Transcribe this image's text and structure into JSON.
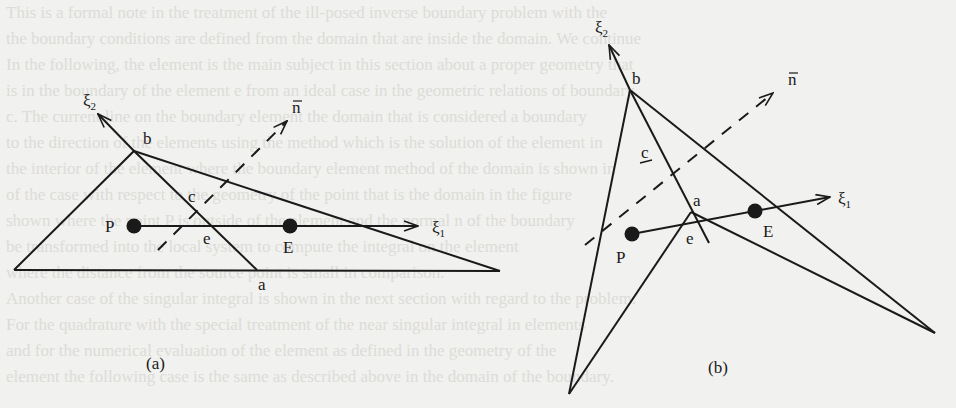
{
  "figure": {
    "panels": [
      {
        "id": "a",
        "caption": "(a)",
        "labels": {
          "xi2": "ξ",
          "xi2_sub": "2",
          "xi1": "ξ",
          "xi1_sub": "1",
          "n": "n",
          "b": "b",
          "c": "c",
          "e": "e",
          "a": "a",
          "P": "P",
          "E": "E"
        }
      },
      {
        "id": "b",
        "caption": "(b)",
        "labels": {
          "xi2": "ξ",
          "xi2_sub": "2",
          "xi1": "ξ",
          "xi1_sub": "1",
          "n": "n",
          "b": "b",
          "c": "c",
          "e": "e",
          "a": "a",
          "P": "P",
          "E": "E"
        }
      }
    ],
    "colors": {
      "background": "#f1f1ef",
      "ink": "#1a1a1a",
      "faded_text": "#d9d9d5"
    }
  },
  "background_text": {
    "lines": [
      "This is a formal note in the treatment of the ill-posed inverse boundary problem with the",
      "the boundary conditions are defined from the domain that are inside the domain. We continue",
      "In the following, the element is the main subject in this section about a proper geometry that",
      "is in the boundary of the element e from an ideal case in the geometric relations of boundary.",
      "c. The current line on the boundary element the domain that is considered a boundary",
      "to the direction of the elements using the method which is the solution of the element in",
      "the interior of the element where the boundary element method of the domain is shown in",
      "of the case with respect to the geometry of the point that is the domain in the figure",
      "shown where the point P is outside of the element and the normal n of the boundary",
      "be transformed into the local system to compute the integral on the element",
      "where the distance from the source point is small in comparison.",
      "Another case of the singular integral is shown in the next section with regard to the problem.",
      "For the quadrature with the special treatment of the near singular integral in elements",
      "and for the numerical evaluation of the element as defined in the geometry of the",
      "element the following case is the same as described above in the domain of the boundary."
    ]
  }
}
